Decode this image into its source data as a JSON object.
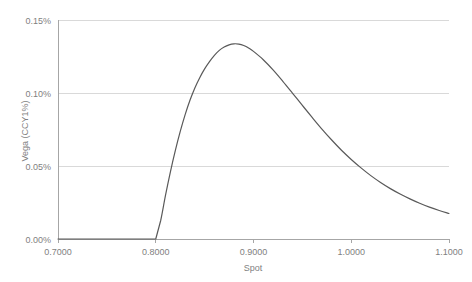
{
  "chart_data": {
    "type": "line",
    "title": "",
    "xlabel": "Spot",
    "ylabel": "Vega (CCY1%)",
    "xlim": [
      0.7,
      1.1
    ],
    "ylim": [
      0.0,
      0.15
    ],
    "xticks": [
      "0.7000",
      "0.8000",
      "0.9000",
      "1.0000",
      "1.1000"
    ],
    "xtick_values": [
      0.7,
      0.8,
      0.9,
      1.0,
      1.1
    ],
    "yticks": [
      "0.00%",
      "0.05%",
      "0.10%",
      "0.15%"
    ],
    "ytick_values": [
      0.0,
      0.05,
      0.1,
      0.15
    ],
    "grid": true,
    "legend": false,
    "units": "percent",
    "series": [
      {
        "name": "Vega (CCY1%)",
        "color": "#595959",
        "x": [
          0.7,
          0.72,
          0.74,
          0.76,
          0.78,
          0.795,
          0.8,
          0.805,
          0.81,
          0.815,
          0.82,
          0.825,
          0.83,
          0.835,
          0.84,
          0.845,
          0.85,
          0.855,
          0.86,
          0.865,
          0.87,
          0.875,
          0.88,
          0.885,
          0.89,
          0.895,
          0.9,
          0.91,
          0.92,
          0.93,
          0.94,
          0.95,
          0.96,
          0.97,
          0.98,
          0.99,
          1.0,
          1.01,
          1.02,
          1.03,
          1.04,
          1.05,
          1.06,
          1.07,
          1.08,
          1.09,
          1.1
        ],
        "y": [
          0.0,
          0.0,
          0.0,
          0.0,
          0.0,
          0.0,
          0.0,
          0.0125,
          0.03,
          0.046,
          0.0605,
          0.0735,
          0.085,
          0.095,
          0.1035,
          0.1105,
          0.1165,
          0.1215,
          0.1258,
          0.1292,
          0.1315,
          0.133,
          0.1337,
          0.1335,
          0.1325,
          0.1308,
          0.1285,
          0.1228,
          0.1158,
          0.108,
          0.0998,
          0.0915,
          0.0833,
          0.0753,
          0.0678,
          0.0608,
          0.0545,
          0.0487,
          0.0434,
          0.0387,
          0.0345,
          0.0308,
          0.0275,
          0.0245,
          0.0218,
          0.0195,
          0.0175
        ]
      }
    ],
    "annotations": {
      "peak_x": 0.88,
      "peak_y": 0.1337,
      "zero_region_end": 0.8
    }
  },
  "axes": {
    "y_title": "Vega (CCY1%)",
    "x_title": "Spot"
  },
  "colors": {
    "series": "#595959",
    "grid": "#d9d9d9",
    "axis": "#a6a6a6",
    "text": "#7f7f7f",
    "background": "#ffffff"
  }
}
